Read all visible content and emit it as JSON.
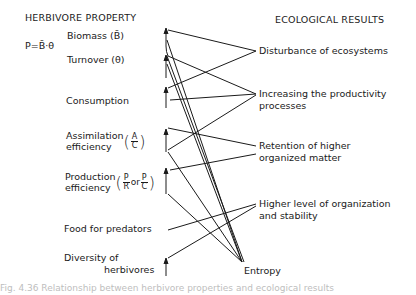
{
  "left_header": "HERBIVORE PROPERTY",
  "right_header": "ECOLOGICAL RESULTS",
  "formula": "P=B̄·θ",
  "properties": {
    "biomass": "Biomass (B̄)",
    "turnover": "Turnover (θ)",
    "consumption": "Consumption",
    "assimilation_line1": "Assimilation",
    "assimilation_line2": "efficiency",
    "assimilation_num": "A",
    "assimilation_den": "C",
    "production_line1": "Production",
    "production_line2": "efficiency",
    "production_num1": "P",
    "production_den1": "R",
    "production_or": "or",
    "production_num2": "P",
    "production_den2": "C",
    "food": "Food for predators",
    "diversity_line1": "Diversity of",
    "diversity_line2": "herbivores"
  },
  "results": {
    "disturbance": "Disturbance of ecosystems",
    "productivity_line1": "Increasing the productivity",
    "productivity_line2": "processes",
    "retention_line1": "Retention of higher",
    "retention_line2": "organized matter",
    "higher_line1": "Higher level of organization",
    "higher_line2": "and stability",
    "entropy": "Entropy"
  },
  "caption": "Fig. 4.36  Relationship between herbivore properties and ecological results"
}
